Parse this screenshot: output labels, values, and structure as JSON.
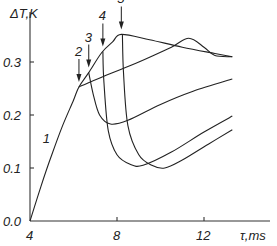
{
  "chart_data": {
    "type": "line",
    "title": "",
    "xlabel": "τ,ms",
    "ylabel": "ΔT,K",
    "xlim": [
      4,
      13.3
    ],
    "ylim": [
      0.0,
      0.37
    ],
    "x_ticks": [
      "4",
      "8",
      "12"
    ],
    "y_ticks": [
      "0.0",
      "0.1",
      "0.2",
      "0.3"
    ],
    "grid": false,
    "legend": "none (curves labeled inline)",
    "annotations": [
      {
        "label": "1",
        "x": 5.6,
        "y": 0.155,
        "type": "curve label"
      },
      {
        "label": "2",
        "x": 6.25,
        "y": 0.253,
        "type": "arrow"
      },
      {
        "label": "3",
        "x": 6.7,
        "y": 0.28,
        "type": "arrow"
      },
      {
        "label": "4",
        "x": 7.35,
        "y": 0.32,
        "type": "arrow"
      },
      {
        "label": "5",
        "x": 8.2,
        "y": 0.352,
        "type": "arrow"
      }
    ],
    "series": [
      {
        "name": "1",
        "x": [
          4.0,
          4.5,
          5.0,
          5.5,
          6.0,
          6.25,
          6.7,
          7.3,
          7.8,
          8.2,
          9.5,
          11.0,
          12.5,
          13.3
        ],
        "y": [
          0.0,
          0.065,
          0.125,
          0.18,
          0.228,
          0.253,
          0.28,
          0.318,
          0.338,
          0.352,
          0.342,
          0.328,
          0.316,
          0.31
        ]
      },
      {
        "name": "2",
        "x": [
          6.25,
          7.5,
          9.0,
          10.5,
          11.3,
          12.0,
          12.5,
          13.3
        ],
        "y": [
          0.253,
          0.275,
          0.3,
          0.328,
          0.345,
          0.328,
          0.312,
          0.31
        ]
      },
      {
        "name": "3",
        "x": [
          6.7,
          6.9,
          7.2,
          7.7,
          8.5,
          10.0,
          11.5,
          13.3
        ],
        "y": [
          0.28,
          0.24,
          0.2,
          0.183,
          0.19,
          0.22,
          0.245,
          0.268
        ]
      },
      {
        "name": "4",
        "x": [
          7.35,
          7.4,
          7.6,
          8.0,
          8.6,
          9.2,
          10.5,
          12.0,
          13.3
        ],
        "y": [
          0.32,
          0.26,
          0.17,
          0.125,
          0.107,
          0.105,
          0.13,
          0.168,
          0.198
        ]
      },
      {
        "name": "5",
        "x": [
          8.25,
          8.3,
          8.5,
          9.0,
          9.6,
          10.2,
          11.0,
          12.2,
          13.3
        ],
        "y": [
          0.352,
          0.28,
          0.18,
          0.125,
          0.105,
          0.1,
          0.115,
          0.145,
          0.172
        ]
      }
    ]
  }
}
